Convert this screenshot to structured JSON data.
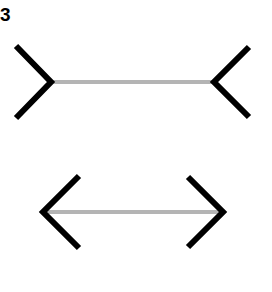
{
  "figure": {
    "label": "3",
    "colors": {
      "shaft": "#b4b4b4",
      "fins": "#000000",
      "background": "#ffffff"
    },
    "lines": [
      {
        "name": "top-line-fins-outward",
        "shaft": {
          "x1": 51,
          "y1": 82,
          "x2": 214,
          "y2": 82
        },
        "left_fin": "16,46 51,82 16,118",
        "right_fin": "249,47 214,82 249,117"
      },
      {
        "name": "bottom-line-fins-inward",
        "shaft": {
          "x1": 43,
          "y1": 212,
          "x2": 223,
          "y2": 212
        },
        "left_fin": "79,176 43,212 79,248",
        "right_fin": "188,177 223,212 188,247"
      }
    ]
  }
}
